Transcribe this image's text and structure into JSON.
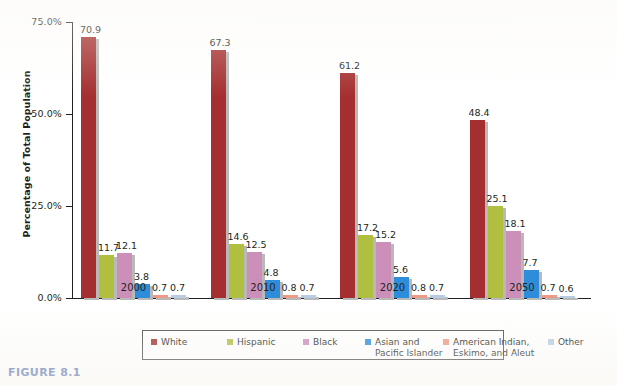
{
  "figure": {
    "caption": "FIGURE 8.1",
    "caption_color": "#5b77b5"
  },
  "chart_data": {
    "type": "bar",
    "title": "",
    "xlabel": "",
    "ylabel": "Percentage of Total Population",
    "ylim": [
      0,
      75
    ],
    "ytick_labels": [
      "75.0%",
      "50.0%",
      "25.0%",
      "0.0%"
    ],
    "ytick_values": [
      75,
      50,
      25,
      0
    ],
    "grid": false,
    "legend_position": "bottom",
    "categories": [
      "2000",
      "2010",
      "2020",
      "2050"
    ],
    "series": [
      {
        "name": "White",
        "color": "#a52f30",
        "values": [
          70.9,
          67.3,
          61.2,
          48.4
        ],
        "labels": [
          "70.9",
          "67.3",
          "61.2",
          "48.4"
        ]
      },
      {
        "name": "Hispanic",
        "color": "#b1bf40",
        "values": [
          11.7,
          14.6,
          17.2,
          25.1
        ],
        "labels": [
          "11.7",
          "14.6",
          "17.2",
          "25.1"
        ]
      },
      {
        "name": "Black",
        "color": "#cb8fba",
        "values": [
          12.1,
          12.5,
          15.2,
          18.1
        ],
        "labels": [
          "12.1",
          "12.5",
          "15.2",
          "18.1"
        ]
      },
      {
        "name": "Asian and Pacific Islander",
        "name_line1": "Asian and",
        "name_line2": "Pacific Islander",
        "color": "#2e8ddb",
        "values": [
          3.8,
          4.8,
          5.6,
          7.7
        ],
        "labels": [
          "3.8",
          "4.8",
          "5.6",
          "7.7"
        ]
      },
      {
        "name": "American Indian, Eskimo, and Aleut",
        "name_line1": "American Indian,",
        "name_line2": "Eskimo, and Aleut",
        "color": "#ef9a86",
        "values": [
          0.7,
          0.8,
          0.8,
          0.7
        ],
        "labels": [
          "0.7",
          "0.8",
          "0.8",
          "0.7"
        ]
      },
      {
        "name": "Other",
        "name_line1": "Other",
        "name_line2": "",
        "color": "#b8cde4",
        "values": [
          0.7,
          0.7,
          0.7,
          0.6
        ],
        "labels": [
          "0.7",
          "0.7",
          "0.7",
          "0.6"
        ]
      }
    ]
  },
  "legend": {
    "items": [
      {
        "label": "White",
        "color": "#a52f30"
      },
      {
        "label": "Hispanic",
        "color": "#b1bf40"
      },
      {
        "label": "Black",
        "color": "#cb8fba"
      },
      {
        "label": "Asian and",
        "label2": "Pacific Islander",
        "color": "#2e8ddb"
      },
      {
        "label": "American Indian,",
        "label2": "Eskimo, and Aleut",
        "color": "#ef9a86"
      },
      {
        "label": "Other",
        "label2": "",
        "color": "#b8cde4"
      }
    ]
  }
}
